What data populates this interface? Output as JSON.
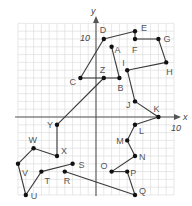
{
  "diagram": {
    "type": "coordinate-grid-dot-to-dot",
    "axes": {
      "x_label": "x",
      "y_label": "y",
      "x_tick_label": "10",
      "y_tick_label": "10",
      "x_range": [
        -10,
        10
      ],
      "y_range": [
        -10,
        12
      ]
    },
    "points": [
      {
        "name": "A",
        "x": 2,
        "y": 9,
        "label_dx": 3,
        "label_dy": 6
      },
      {
        "name": "B",
        "x": 3,
        "y": 5,
        "label_dx": -2,
        "label_dy": 13
      },
      {
        "name": "C",
        "x": -2,
        "y": 5,
        "label_dx": -11,
        "label_dy": 7
      },
      {
        "name": "D",
        "x": 1,
        "y": 10,
        "label_dx": -4,
        "label_dy": -6
      },
      {
        "name": "E",
        "x": 5,
        "y": 11,
        "label_dx": 6,
        "label_dy": 0
      },
      {
        "name": "F",
        "x": 5,
        "y": 10,
        "label_dx": -3,
        "label_dy": 14
      },
      {
        "name": "G",
        "x": 8,
        "y": 10,
        "label_dx": 5,
        "label_dy": 3
      },
      {
        "name": "H",
        "x": 9,
        "y": 7,
        "label_dx": 0,
        "label_dy": 13
      },
      {
        "name": "I",
        "x": 4,
        "y": 6,
        "label_dx": -5,
        "label_dy": -4
      },
      {
        "name": "J",
        "x": 5,
        "y": 2,
        "label_dx": -9,
        "label_dy": 7
      },
      {
        "name": "K",
        "x": 8,
        "y": 0,
        "label_dx": -5,
        "label_dy": -5
      },
      {
        "name": "L",
        "x": 5,
        "y": -1,
        "label_dx": 4,
        "label_dy": 9
      },
      {
        "name": "M",
        "x": 4,
        "y": -3,
        "label_dx": -11,
        "label_dy": 4
      },
      {
        "name": "N",
        "x": 5,
        "y": -5,
        "label_dx": 4,
        "label_dy": 4
      },
      {
        "name": "O",
        "x": 2,
        "y": -7,
        "label_dx": -11,
        "label_dy": -3
      },
      {
        "name": "P",
        "x": 4,
        "y": -7,
        "label_dx": 3,
        "label_dy": 4
      },
      {
        "name": "Q",
        "x": 5,
        "y": -10,
        "label_dx": 4,
        "label_dy": -1
      },
      {
        "name": "R",
        "x": -4,
        "y": -7,
        "label_dx": -1,
        "label_dy": 12
      },
      {
        "name": "S",
        "x": -3,
        "y": -6,
        "label_dx": 6,
        "label_dy": 4
      },
      {
        "name": "T",
        "x": -7,
        "y": -7,
        "label_dx": 3,
        "label_dy": 12
      },
      {
        "name": "U",
        "x": -9,
        "y": -10,
        "label_dx": 5,
        "label_dy": 4
      },
      {
        "name": "V",
        "x": -10,
        "y": -6,
        "label_dx": 4,
        "label_dy": 12
      },
      {
        "name": "W",
        "x": -8,
        "y": -4,
        "label_dx": -5,
        "label_dy": -5
      },
      {
        "name": "X",
        "x": -5,
        "y": -5,
        "label_dx": 4,
        "label_dy": -2
      },
      {
        "name": "Y",
        "x": -5,
        "y": -1,
        "label_dx": -10,
        "label_dy": 3
      },
      {
        "name": "Z",
        "x": 1,
        "y": 5,
        "label_dx": -4,
        "label_dy": -5
      }
    ],
    "segments": [
      [
        "A",
        "B"
      ],
      [
        "B",
        "Z"
      ],
      [
        "Z",
        "C"
      ],
      [
        "C",
        "D"
      ],
      [
        "D",
        "E"
      ],
      [
        "E",
        "F"
      ],
      [
        "F",
        "G"
      ],
      [
        "G",
        "H"
      ],
      [
        "H",
        "I"
      ],
      [
        "I",
        "J"
      ],
      [
        "J",
        "K"
      ],
      [
        "K",
        "L"
      ],
      [
        "L",
        "M"
      ],
      [
        "M",
        "N"
      ],
      [
        "N",
        "O"
      ],
      [
        "O",
        "P"
      ],
      [
        "P",
        "Q"
      ],
      [
        "Q",
        "R"
      ],
      [
        "S",
        "T"
      ],
      [
        "T",
        "U"
      ],
      [
        "U",
        "V"
      ],
      [
        "V",
        "W"
      ],
      [
        "W",
        "X"
      ],
      [
        "X",
        "Y"
      ],
      [
        "Y",
        "Z"
      ]
    ]
  },
  "colors": {
    "grid": "#d9d9d9",
    "axis": "#555555",
    "line": "#3a3a3a",
    "point": "#111111",
    "label": "#555555"
  }
}
